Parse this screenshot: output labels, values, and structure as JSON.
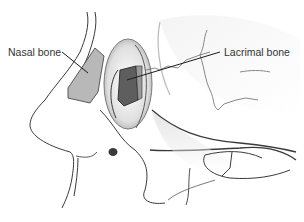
{
  "diagram": {
    "labels": [
      {
        "id": "nasal",
        "text": "Nasal bone"
      },
      {
        "id": "lacrimal",
        "text": "Lacrimal bone"
      }
    ],
    "colors": {
      "background": "#ffffff",
      "outline": "#3a3a3a",
      "nasal_bone_fill": "#b8b8b8",
      "lacrimal_bone_fill": "#5e5e5e",
      "orbit_rim_fill": "#9a9a9a",
      "shading": "#d8d8d8",
      "label_text": "#333333",
      "leader_line": "#1a1a1a"
    }
  }
}
